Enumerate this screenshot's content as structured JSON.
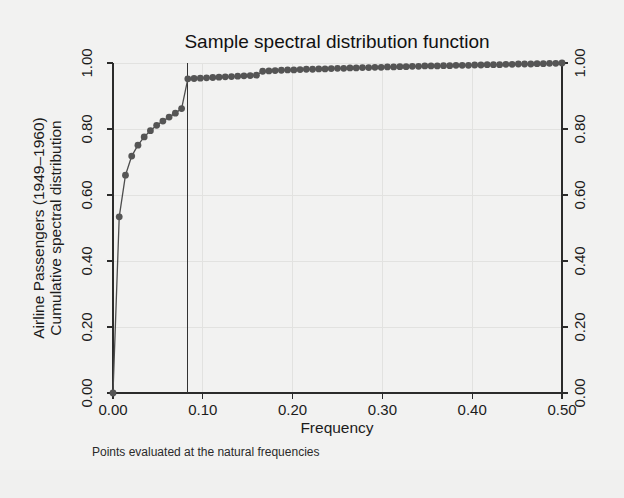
{
  "chart_data": {
    "type": "line",
    "title": "Sample spectral distribution function",
    "subtitle": "",
    "xlabel": "Frequency",
    "ylabel_line1": "Airline Passengers (1949–1960)",
    "ylabel_line2": "Cumulative spectral distribution",
    "ylabel_right_line1": "",
    "note": "Points evaluated at the natural frequencies",
    "xlim": [
      0.0,
      0.5
    ],
    "ylim": [
      0.0,
      1.0
    ],
    "xticks": [
      0.0,
      0.1,
      0.2,
      0.3,
      0.4,
      0.5
    ],
    "xticklabels": [
      "0.00",
      "0.10",
      "0.20",
      "0.30",
      "0.40",
      "0.50"
    ],
    "yticks": [
      0.0,
      0.2,
      0.4,
      0.6,
      0.8,
      1.0
    ],
    "yticklabels": [
      "0.00",
      "0.20",
      "0.40",
      "0.60",
      "0.80",
      "1.00"
    ],
    "right_yticks": [
      0.0,
      0.2,
      0.4,
      0.6,
      0.8,
      1.0
    ],
    "right_yticklabels": [
      "0.00",
      "0.20",
      "0.40",
      "0.60",
      "0.80",
      "1.00"
    ],
    "grid": true,
    "legend": "none",
    "marker": "circle",
    "marker_color": "#555555",
    "line_color": "#4d4d4d",
    "reference_line_x": 0.0833,
    "reference_line_label": "",
    "series": [
      {
        "name": "Cumulative spectral distribution",
        "x": [
          0.0,
          0.00694,
          0.01389,
          0.02083,
          0.02778,
          0.03472,
          0.04167,
          0.04861,
          0.05556,
          0.0625,
          0.06944,
          0.07639,
          0.08333,
          0.09028,
          0.09722,
          0.10417,
          0.11111,
          0.11806,
          0.125,
          0.13194,
          0.13889,
          0.14583,
          0.15278,
          0.15972,
          0.16667,
          0.17361,
          0.18056,
          0.1875,
          0.19444,
          0.20139,
          0.20833,
          0.21528,
          0.22222,
          0.22917,
          0.23611,
          0.24306,
          0.25,
          0.25694,
          0.26389,
          0.27083,
          0.27778,
          0.28472,
          0.29167,
          0.29861,
          0.30556,
          0.3125,
          0.31944,
          0.32639,
          0.33333,
          0.34028,
          0.34722,
          0.35417,
          0.36111,
          0.36806,
          0.375,
          0.38194,
          0.38889,
          0.39583,
          0.40278,
          0.40972,
          0.41667,
          0.42361,
          0.43056,
          0.4375,
          0.44444,
          0.45139,
          0.45833,
          0.46528,
          0.47222,
          0.47917,
          0.48611,
          0.49306,
          0.5
        ],
        "y": [
          0.0,
          0.534,
          0.66,
          0.718,
          0.751,
          0.776,
          0.795,
          0.811,
          0.824,
          0.836,
          0.848,
          0.862,
          0.952,
          0.953,
          0.954,
          0.955,
          0.956,
          0.957,
          0.958,
          0.959,
          0.96,
          0.961,
          0.962,
          0.963,
          0.975,
          0.976,
          0.977,
          0.978,
          0.979,
          0.979,
          0.98,
          0.981,
          0.981,
          0.982,
          0.982,
          0.983,
          0.984,
          0.984,
          0.985,
          0.985,
          0.986,
          0.986,
          0.987,
          0.987,
          0.988,
          0.988,
          0.989,
          0.989,
          0.99,
          0.99,
          0.991,
          0.991,
          0.991,
          0.992,
          0.992,
          0.993,
          0.993,
          0.993,
          0.994,
          0.994,
          0.995,
          0.995,
          0.995,
          0.996,
          0.996,
          0.997,
          0.997,
          0.997,
          0.998,
          0.998,
          0.999,
          0.999,
          1.0
        ]
      }
    ]
  }
}
